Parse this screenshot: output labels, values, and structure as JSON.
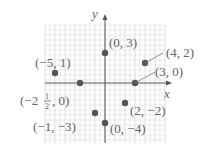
{
  "chart_data": {
    "type": "scatter",
    "title": "",
    "xlabel": "x",
    "ylabel": "y",
    "xlim": [
      -6,
      6
    ],
    "ylim": [
      -6,
      6
    ],
    "grid": true,
    "points": [
      {
        "x": 0,
        "y": 3,
        "label": "(0, 3)"
      },
      {
        "x": 4,
        "y": 2,
        "label": "(4, 2)"
      },
      {
        "x": -5,
        "y": 1,
        "label": "(−5, 1)"
      },
      {
        "x": 3,
        "y": 0,
        "label": "(3, 0)"
      },
      {
        "x": -2.5,
        "y": 0,
        "label": "(−2½, 0)"
      },
      {
        "x": 2,
        "y": -2,
        "label": "(2, −2)"
      },
      {
        "x": -1,
        "y": -3,
        "label": "(−1, −3)"
      },
      {
        "x": 0,
        "y": -4,
        "label": "(0, −4)"
      }
    ]
  },
  "axes": {
    "x_label": "x",
    "y_label": "y"
  },
  "colors": {
    "grid": "#d4d4d4",
    "axis": "#555555",
    "point": "#555555",
    "text": "#666666"
  },
  "labels": {
    "p_0_3": "(0, 3)",
    "p_4_2": "(4, 2)",
    "p_m5_1": "(−5, 1)",
    "p_3_0": "(3, 0)",
    "p_m25_0_a": "(−2",
    "p_m25_0_num": "1",
    "p_m25_0_den": "2",
    "p_m25_0_b": ", 0)",
    "p_2_m2": "(2, −2)",
    "p_m1_m3": "(−1, −3)",
    "p_0_m4": "(0, −4)"
  }
}
